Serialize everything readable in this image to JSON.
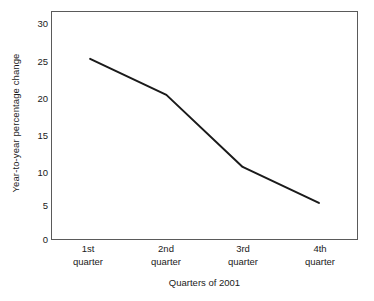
{
  "chart_data": {
    "type": "line",
    "title": "",
    "subtitle": "",
    "xlabel": "Quarters of 2001",
    "ylabel": "Year-to-year percentage change",
    "categories": [
      "1st quarter",
      "2nd quarter",
      "3rd quarter",
      "4th quarter"
    ],
    "category_lines": [
      [
        "1st",
        "quarter"
      ],
      [
        "2nd",
        "quarter"
      ],
      [
        "3rd",
        "quarter"
      ],
      [
        "4th",
        "quarter"
      ]
    ],
    "values": [
      25,
      20,
      10,
      5
    ],
    "series": [
      {
        "name": "Year-to-year percentage change",
        "values": [
          25,
          20,
          10,
          5
        ]
      }
    ],
    "ylim": [
      0,
      31.5
    ],
    "yticks": [
      0,
      5,
      10,
      15,
      20,
      25,
      30
    ],
    "ytick_labels": [
      "0",
      "5",
      "10",
      "15",
      "20",
      "25",
      "30"
    ],
    "grid": false,
    "legend": false,
    "legend_position": "none",
    "markers": false,
    "line_color": "#1a1a1a",
    "line_width": 2,
    "frame_color": "#5a5a5a",
    "background_color": "#ffffff",
    "annotations": []
  },
  "axes": {
    "y_title": "Year-to-year percentage change",
    "x_title": "Quarters of 2001"
  }
}
